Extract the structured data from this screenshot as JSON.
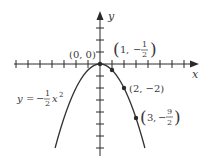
{
  "figure": {
    "axes": {
      "x_label": "x",
      "y_label": "y",
      "unit_px": 12,
      "origin": [
        100,
        64
      ]
    },
    "equation": {
      "lhs": "y",
      "eq": "=",
      "neg": "−",
      "num": "1",
      "den": "2",
      "var": "x",
      "exp": "2"
    },
    "points": [
      {
        "label_open": "(",
        "x": "0",
        "sep": ", ",
        "y": "0",
        "label_close": ")",
        "text": "(0, 0)"
      },
      {
        "x": "1",
        "y_num": "1",
        "y_den": "2",
        "neg": "−"
      },
      {
        "x": "2",
        "y": "−2",
        "text": "(2, −2)"
      },
      {
        "x": "3",
        "y_num": "9",
        "y_den": "2",
        "neg": "−"
      }
    ],
    "colors": {
      "curve": "#333333",
      "axis": "#2a2a2a",
      "text": "#3a3a3a"
    }
  }
}
